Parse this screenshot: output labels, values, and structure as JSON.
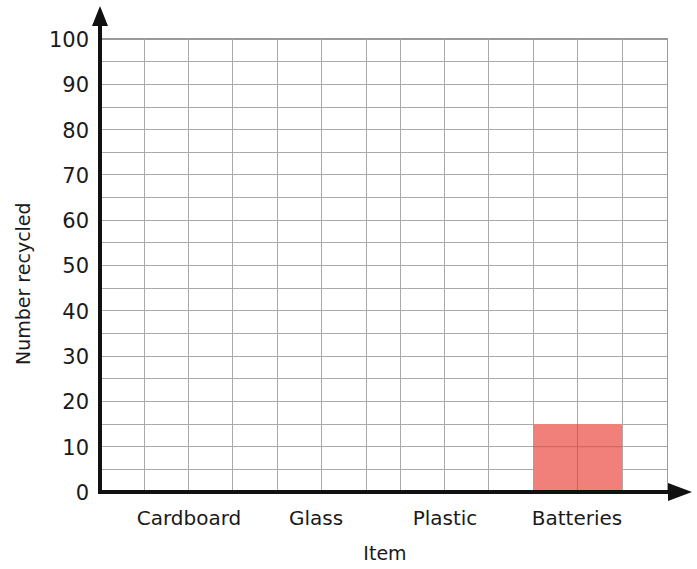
{
  "chart_data": {
    "type": "bar",
    "title": "",
    "subtitle": "",
    "xlabel": "Item",
    "ylabel": "Number recycled",
    "categories": [
      "Cardboard",
      "Glass",
      "Plastic",
      "Batteries"
    ],
    "values": [
      null,
      null,
      null,
      15
    ],
    "ylim": [
      0,
      100
    ],
    "y_major_ticks": [
      0,
      10,
      20,
      30,
      40,
      50,
      60,
      70,
      80,
      90,
      100
    ],
    "y_tick_labels": [
      "0",
      "10",
      "20",
      "30",
      "40",
      "50",
      "60",
      "70",
      "80",
      "90",
      "100"
    ],
    "y_minor_step": 5,
    "grid": true,
    "legend": "none",
    "bar_color": "#f2807a",
    "axis_color": "#111111",
    "grid_color": "#aaaaaa",
    "annotations": []
  },
  "axes": {
    "y_axis_title": "Number recycled",
    "x_axis_title": "Item"
  },
  "y_ticks": [
    {
      "label": "100",
      "value": 100
    },
    {
      "label": "90",
      "value": 90
    },
    {
      "label": "80",
      "value": 80
    },
    {
      "label": "70",
      "value": 70
    },
    {
      "label": "60",
      "value": 60
    },
    {
      "label": "50",
      "value": 50
    },
    {
      "label": "40",
      "value": 40
    },
    {
      "label": "30",
      "value": 30
    },
    {
      "label": "20",
      "value": 20
    },
    {
      "label": "10",
      "value": 10
    },
    {
      "label": "0",
      "value": 0
    }
  ],
  "x_ticks": [
    {
      "label": "Cardboard",
      "center": 189
    },
    {
      "label": "Glass",
      "center": 315
    },
    {
      "label": "Plastic",
      "center": 444
    },
    {
      "label": "Batteries",
      "center": 577
    }
  ],
  "bars": [
    {
      "category": "Batteries",
      "value": 15,
      "color": "#f2807a",
      "x": 533,
      "width": 89
    }
  ]
}
